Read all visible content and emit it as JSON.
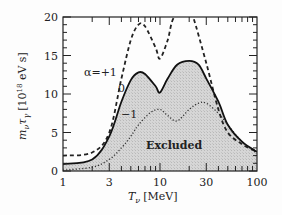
{
  "chart_data": {
    "type": "line",
    "title": "",
    "xlabel": "T_ν [MeV]",
    "ylabel": "m_ν τ_γ [10^18 eV s]",
    "xscale": "log",
    "xlim": [
      1,
      100
    ],
    "ylim": [
      0,
      20
    ],
    "xticks": [
      1,
      3,
      10,
      30,
      100
    ],
    "xtick_labels": [
      "1",
      "3",
      "10",
      "30",
      "100"
    ],
    "yticks": [
      0,
      5,
      10,
      15,
      20
    ],
    "ytick_labels": [
      "0",
      "5",
      "10",
      "15",
      "20"
    ],
    "grid": false,
    "legend": null,
    "annotations": [
      {
        "text": "α=+1",
        "series": "alpha_plus1"
      },
      {
        "text": "0",
        "series": "alpha_0"
      },
      {
        "text": "−1",
        "series": "alpha_minus1"
      },
      {
        "text": "Excluded",
        "region": "below α=0 curve (shaded)"
      }
    ],
    "series": [
      {
        "name": "α=+1",
        "style": "dashed",
        "x": [
          1,
          2,
          3,
          4,
          5,
          6,
          7,
          9,
          10,
          12,
          14,
          20,
          22,
          30,
          40,
          50,
          70,
          100
        ],
        "y": [
          2.0,
          2.4,
          5.0,
          12.0,
          17.0,
          19.0,
          18.8,
          16.0,
          14.6,
          17.0,
          20.0,
          21.0,
          20.0,
          14.0,
          8.0,
          5.0,
          3.5,
          2.5
        ]
      },
      {
        "name": "α=0",
        "style": "solid",
        "shaded_below": true,
        "x": [
          1,
          2,
          3,
          4,
          5,
          6,
          7,
          9,
          10,
          12,
          15,
          20,
          25,
          30,
          40,
          50,
          70,
          100
        ],
        "y": [
          0.9,
          1.5,
          4.5,
          9.0,
          11.8,
          12.8,
          12.6,
          11.0,
          10.2,
          12.0,
          13.8,
          14.3,
          13.8,
          12.0,
          9.0,
          6.0,
          3.8,
          2.5
        ]
      },
      {
        "name": "α=−1",
        "style": "dotted",
        "x": [
          1,
          2,
          3,
          4,
          5,
          6,
          8,
          10,
          12,
          15,
          20,
          25,
          30,
          40,
          50,
          70,
          100
        ],
        "y": [
          0.1,
          0.5,
          1.5,
          3.0,
          4.5,
          6.0,
          7.6,
          8.0,
          7.2,
          6.5,
          8.0,
          8.8,
          8.8,
          7.5,
          6.0,
          3.8,
          2.3
        ]
      }
    ]
  },
  "labels": {
    "alpha_plus1": "α=+1",
    "alpha_0": "0",
    "alpha_minus1": "−1",
    "excluded": "Excluded",
    "x_axis_T": "T",
    "x_axis_sub": "ν",
    "x_axis_unit": "[MeV]",
    "y_axis": "m",
    "y_axis_sub1": "ν",
    "y_axis_tau": "τ",
    "y_axis_sub2": "γ",
    "y_axis_unit": "[10",
    "y_axis_exp": "18",
    "y_axis_unit2": " eV s]"
  }
}
